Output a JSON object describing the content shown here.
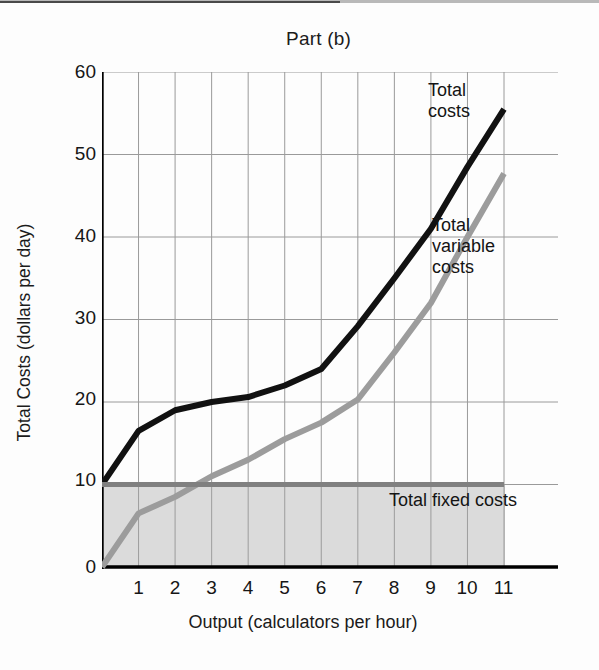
{
  "chart_data": {
    "type": "line",
    "title": "Part (b)",
    "xlabel": "Output (calculators per hour)",
    "ylabel": "Total Costs (dollars per day)",
    "xlim": [
      0,
      11
    ],
    "ylim": [
      0,
      60
    ],
    "xticks": [
      "1",
      "2",
      "3",
      "4",
      "5",
      "6",
      "7",
      "8",
      "9",
      "10",
      "11"
    ],
    "yticks": [
      "0",
      "10",
      "20",
      "30",
      "40",
      "50",
      "60"
    ],
    "grid": true,
    "legend_position": "inline-annotations",
    "x": [
      0,
      1,
      2,
      3,
      4,
      5,
      6,
      7,
      8,
      9,
      10,
      11
    ],
    "series": [
      {
        "name": "Total costs",
        "color": "#111111",
        "values": [
          10,
          16.5,
          19,
          20,
          20.6,
          22,
          24,
          29.2,
          35,
          41,
          48.5,
          55.5
        ]
      },
      {
        "name": "Total variable costs",
        "color": "#9c9c9c",
        "values": [
          0,
          6.5,
          8.5,
          11,
          13,
          15.5,
          17.5,
          20.3,
          26,
          32,
          40,
          47.7
        ]
      },
      {
        "name": "Total fixed costs",
        "color": "#808080",
        "values": [
          10,
          10,
          10,
          10,
          10,
          10,
          10,
          10,
          10,
          10,
          10,
          10
        ]
      }
    ],
    "annotations": [
      {
        "text": "Total costs",
        "series": "Total costs"
      },
      {
        "text": "Total variable costs",
        "series": "Total variable costs"
      },
      {
        "text": "Total fixed costs",
        "series": "Total fixed costs"
      }
    ],
    "shaded_region": {
      "label": "Total fixed costs",
      "from": 0,
      "to": 10,
      "fill": "#d8d8d8"
    }
  },
  "annotations": {
    "total_costs": "Total\ncosts",
    "total_costs_line1": "Total",
    "total_costs_line2": "costs",
    "total_variable_costs_line1": "Total",
    "total_variable_costs_line2": "variable",
    "total_variable_costs_line3": "costs",
    "total_fixed_costs": "Total fixed costs"
  }
}
